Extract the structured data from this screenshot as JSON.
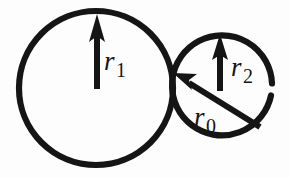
{
  "figure": {
    "background_color": "#fdfdfd",
    "ink_color": "#151515",
    "shapes": {
      "large_circle": {
        "name": "large-circle",
        "center_x": 96,
        "center_y": 88,
        "radius": 77,
        "stroke_width": 6
      },
      "small_circle": {
        "name": "small-circle",
        "center_x": 222,
        "center_y": 88,
        "radius": 50,
        "stroke_width": 6,
        "gap_note": "small break in stroke at right side"
      }
    },
    "arrows": {
      "r1": {
        "label_var": "r",
        "label_sub": "1",
        "from_x": 97,
        "from_y": 88,
        "to_x": 97,
        "to_y": 15,
        "description": "radius arrow of large circle pointing up"
      },
      "r2": {
        "label_var": "r",
        "label_sub": "2",
        "from_x": 220,
        "from_y": 90,
        "to_x": 220,
        "to_y": 35,
        "description": "radius arrow of small circle pointing up"
      },
      "r0": {
        "label_var": "r",
        "label_sub": "0",
        "from_x": 259,
        "from_y": 126,
        "to_x": 175,
        "to_y": 74,
        "description": "arrow pointing to tangency point of the two circles"
      }
    },
    "labels": {
      "r1": {
        "var": "r",
        "sub": "1"
      },
      "r2": {
        "var": "r",
        "sub": "2"
      },
      "r0": {
        "var": "r",
        "sub": "0"
      }
    }
  }
}
